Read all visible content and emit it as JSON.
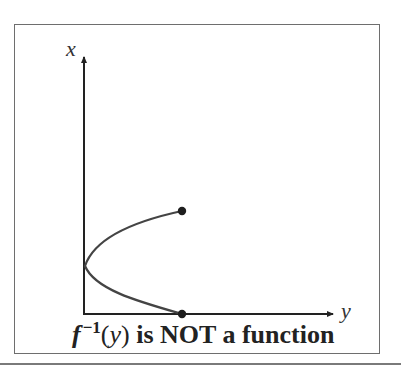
{
  "diagram": {
    "axes": {
      "vertical_label": "x",
      "horizontal_label": "y"
    },
    "caption": {
      "function_symbol": "f",
      "superscript": "−1",
      "open_paren": "(",
      "variable": "y",
      "close_paren": ")",
      "statement": " is NOT a function"
    },
    "curve": {
      "shape": "sideways parabola opening to the right",
      "endpoints": [
        "top-closed-dot",
        "bottom-closed-dot-on-horizontal-axis"
      ],
      "vertex": "on vertical axis"
    },
    "colors": {
      "axis": "#222222",
      "curve": "#444444",
      "dots": "#1e1e1e",
      "frame": "#6e6e6e",
      "separator": "#7a7a7a",
      "text": "#222222"
    }
  }
}
